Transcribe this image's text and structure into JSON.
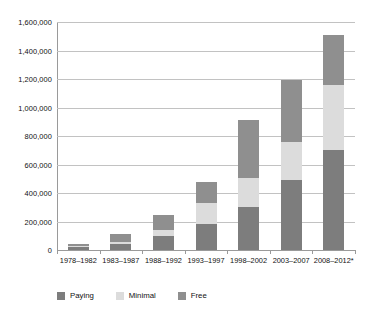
{
  "chart_data": {
    "type": "bar",
    "stacked": true,
    "title": "",
    "subtitle": "",
    "xlabel": "",
    "ylabel": "",
    "ylim": [
      0,
      1600000
    ],
    "ytick_step": 200000,
    "grid": true,
    "legend_position": "bottom-left",
    "categories": [
      "1978–1982",
      "1983–1987",
      "1988–1992",
      "1993–1997",
      "1998–2002",
      "2003–2007",
      "2008–2012*"
    ],
    "ytick_labels": [
      "0",
      "200,000",
      "400,000",
      "600,000",
      "800,000",
      "1,000,000",
      "1,200,000",
      "1,400,000",
      "1,600,000"
    ],
    "ytick_values": [
      0,
      200000,
      400000,
      600000,
      800000,
      1000000,
      1200000,
      1400000,
      1600000
    ],
    "series": [
      {
        "name": "Paying",
        "color": "#7d7d7d",
        "values": [
          20000,
          45000,
          95000,
          185000,
          300000,
          490000,
          705000
        ]
      },
      {
        "name": "Minimal",
        "color": "#dcdcdc",
        "values": [
          8000,
          10000,
          45000,
          145000,
          205000,
          265000,
          450000
        ]
      },
      {
        "name": "Free",
        "color": "#8f8f8f",
        "values": [
          12000,
          60000,
          105000,
          145000,
          410000,
          435000,
          355000
        ]
      }
    ],
    "totals": [
      40000,
      115000,
      245000,
      475000,
      915000,
      1190000,
      1510000
    ]
  },
  "legend": {
    "items": [
      {
        "label": "Paying",
        "color": "#7d7d7d"
      },
      {
        "label": "Minimal",
        "color": "#dcdcdc"
      },
      {
        "label": "Free",
        "color": "#8f8f8f"
      }
    ]
  }
}
